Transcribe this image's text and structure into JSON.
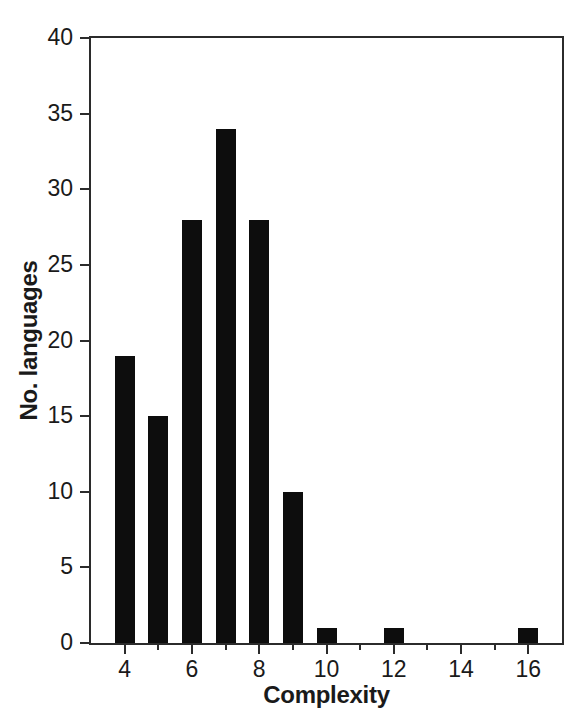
{
  "chart_data": {
    "type": "bar",
    "title": "",
    "subtitle": "",
    "xlabel": "Complexity",
    "ylabel": "No. languages",
    "categories": [
      4,
      5,
      6,
      7,
      8,
      9,
      10,
      12,
      16
    ],
    "values": [
      19,
      15,
      28,
      34,
      28,
      10,
      1,
      1,
      1
    ],
    "series": [
      {
        "name": "No. languages",
        "values": [
          19,
          15,
          28,
          34,
          28,
          10,
          1,
          1,
          1
        ],
        "color": "#0d0d0d"
      }
    ],
    "xlim": [
      3,
      17
    ],
    "ylim": [
      0,
      40
    ],
    "ytick_labels": [
      "0",
      "5",
      "10",
      "15",
      "20",
      "25",
      "30",
      "35",
      "40"
    ],
    "ytick_values": [
      0,
      5,
      10,
      15,
      20,
      25,
      30,
      35,
      40
    ],
    "xtick_labels": [
      "4",
      "6",
      "8",
      "10",
      "12",
      "14",
      "16"
    ],
    "xtick_values": [
      4,
      6,
      8,
      10,
      12,
      14,
      16
    ],
    "xtick_minor_values": [
      3,
      5,
      7,
      9,
      11,
      13,
      15,
      17
    ],
    "grid": false,
    "legend": false,
    "legend_position": "none",
    "annotations": [],
    "bar_color": "#0d0d0d",
    "axis_color": "#2b2b2b",
    "background_color": "#ffffff"
  },
  "figure": {
    "x_axis_title": "Complexity",
    "y_axis_title": "No. languages"
  }
}
